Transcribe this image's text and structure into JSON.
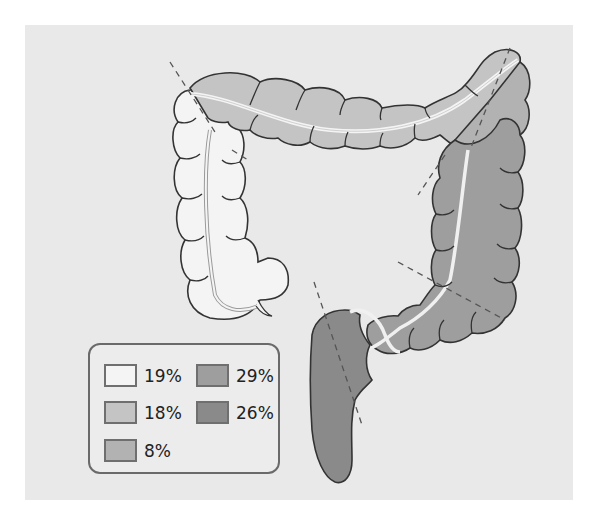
{
  "diagram": {
    "segments": [
      {
        "name": "cecum-ascending-colon",
        "percent": "19%",
        "color": "#f4f4f4"
      },
      {
        "name": "transverse-colon",
        "percent": "18%",
        "color": "#c4c4c4"
      },
      {
        "name": "splenic-flexure",
        "percent": "8%",
        "color": "#b2b2b2"
      },
      {
        "name": "descending-colon",
        "percent": "29%",
        "color": "#9e9e9e"
      },
      {
        "name": "sigmoid-rectum",
        "percent": "26%",
        "color": "#8a8a8a"
      }
    ]
  },
  "legend": {
    "items": [
      {
        "label": "19%",
        "color": "#f4f4f4"
      },
      {
        "label": "18%",
        "color": "#c4c4c4"
      },
      {
        "label": "8%",
        "color": "#b2b2b2"
      },
      {
        "label": "29%",
        "color": "#9e9e9e"
      },
      {
        "label": "26%",
        "color": "#8a8a8a"
      }
    ]
  }
}
